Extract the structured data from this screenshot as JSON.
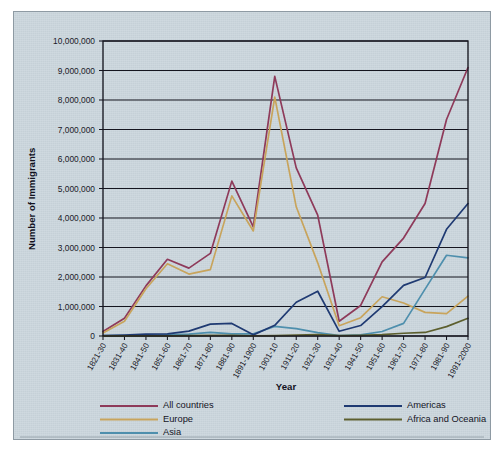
{
  "chart_data": {
    "type": "line",
    "title": "",
    "xlabel": "Year",
    "ylabel": "Number of Immigrants",
    "ylim": [
      0,
      10000000
    ],
    "ytick_step": 1000000,
    "grid": true,
    "legend_position": "bottom",
    "categories": [
      "1821-30",
      "1831-40",
      "1841-50",
      "1851-60",
      "1861-70",
      "1871-80",
      "1881-90",
      "1891-1900",
      "1901-10",
      "1911-20",
      "1921-30",
      "1931-40",
      "1941-50",
      "1951-60",
      "1961-70",
      "1971-80",
      "1981-90",
      "1991-2000"
    ],
    "ytick_labels": [
      "0",
      "1,000,000",
      "2,000,000",
      "3,000,000",
      "4,000,000",
      "5,000,000",
      "6,000,000",
      "7,000,000",
      "8,000,000",
      "9,000,000",
      "10,000,000"
    ],
    "series": [
      {
        "name": "All countries",
        "color": "#8e3a5a",
        "values": [
          150000,
          600000,
          1700000,
          2600000,
          2300000,
          2800000,
          5250000,
          3700000,
          8800000,
          5700000,
          4100000,
          500000,
          1035000,
          2515000,
          3320000,
          4490000,
          7340000,
          9100000
        ]
      },
      {
        "name": "Europe",
        "color": "#c8a45c",
        "values": [
          100000,
          500000,
          1600000,
          2450000,
          2100000,
          2250000,
          4750000,
          3560000,
          8100000,
          4380000,
          2480000,
          350000,
          620000,
          1330000,
          1120000,
          800000,
          760000,
          1350000
        ]
      },
      {
        "name": "Asia",
        "color": "#4e8fad",
        "values": [
          10000,
          10000,
          10000,
          41000,
          64000,
          124000,
          69000,
          74000,
          324000,
          247000,
          112000,
          17000,
          37000,
          153000,
          428000,
          1588000,
          2738000,
          2650000
        ]
      },
      {
        "name": "Americas",
        "color": "#1f3a72",
        "values": [
          12000,
          33000,
          62000,
          75000,
          167000,
          404000,
          427000,
          39000,
          362000,
          1144000,
          1517000,
          160000,
          355000,
          997000,
          1716000,
          1983000,
          3616000,
          4490000
        ]
      },
      {
        "name": "Africa and Oceania",
        "color": "#5c5f2e",
        "values": [
          2000,
          3000,
          4000,
          6000,
          12000,
          19000,
          20000,
          8000,
          15000,
          27000,
          46000,
          10000,
          21000,
          46000,
          93000,
          120000,
          317000,
          600000
        ]
      }
    ]
  },
  "axis": {
    "y_title": "Number of Immigrants",
    "x_title": "Year"
  },
  "legend": {
    "left_column": [
      {
        "label": "All countries",
        "color": "#8e3a5a"
      },
      {
        "label": "Europe",
        "color": "#c8a45c"
      },
      {
        "label": "Asia",
        "color": "#4e8fad"
      }
    ],
    "right_column": [
      {
        "label": "Americas",
        "color": "#1f3a72"
      },
      {
        "label": "Africa and Oceania",
        "color": "#5c5f2e"
      }
    ]
  },
  "colors": {
    "panel_background": "#ccd7de",
    "axis": "#15151f",
    "page_background": "#ffffff"
  }
}
